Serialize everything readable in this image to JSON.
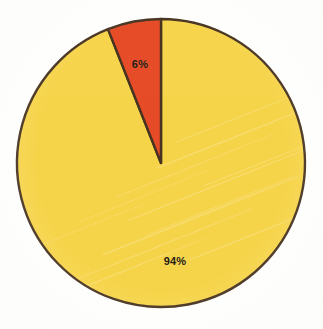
{
  "chart_data": {
    "type": "pie",
    "title": "",
    "subtitle": "",
    "xlabel": "",
    "ylabel": "",
    "legend_position": "none",
    "grid": false,
    "labels_shown_on_slices": true,
    "categories": [
      "6%",
      "94%"
    ],
    "values": [
      6,
      94
    ],
    "units": "percent",
    "total": 100,
    "start_angle_deg": 0,
    "direction": "counterclockwise",
    "slices": [
      {
        "label": "6%",
        "value": 6,
        "color": "#E54C27",
        "start_angle_deg": 338.4,
        "end_angle_deg": 360.0
      },
      {
        "label": "94%",
        "value": 94,
        "color": "#F6D44B",
        "start_angle_deg": 0.0,
        "end_angle_deg": 338.4
      }
    ]
  },
  "chart": {
    "center_x": 161,
    "center_y": 163,
    "radius": 144,
    "outline_color": "#473320",
    "outline_width": 2.4,
    "background_color": "#FEFEFD",
    "label_color": "#241A10"
  }
}
